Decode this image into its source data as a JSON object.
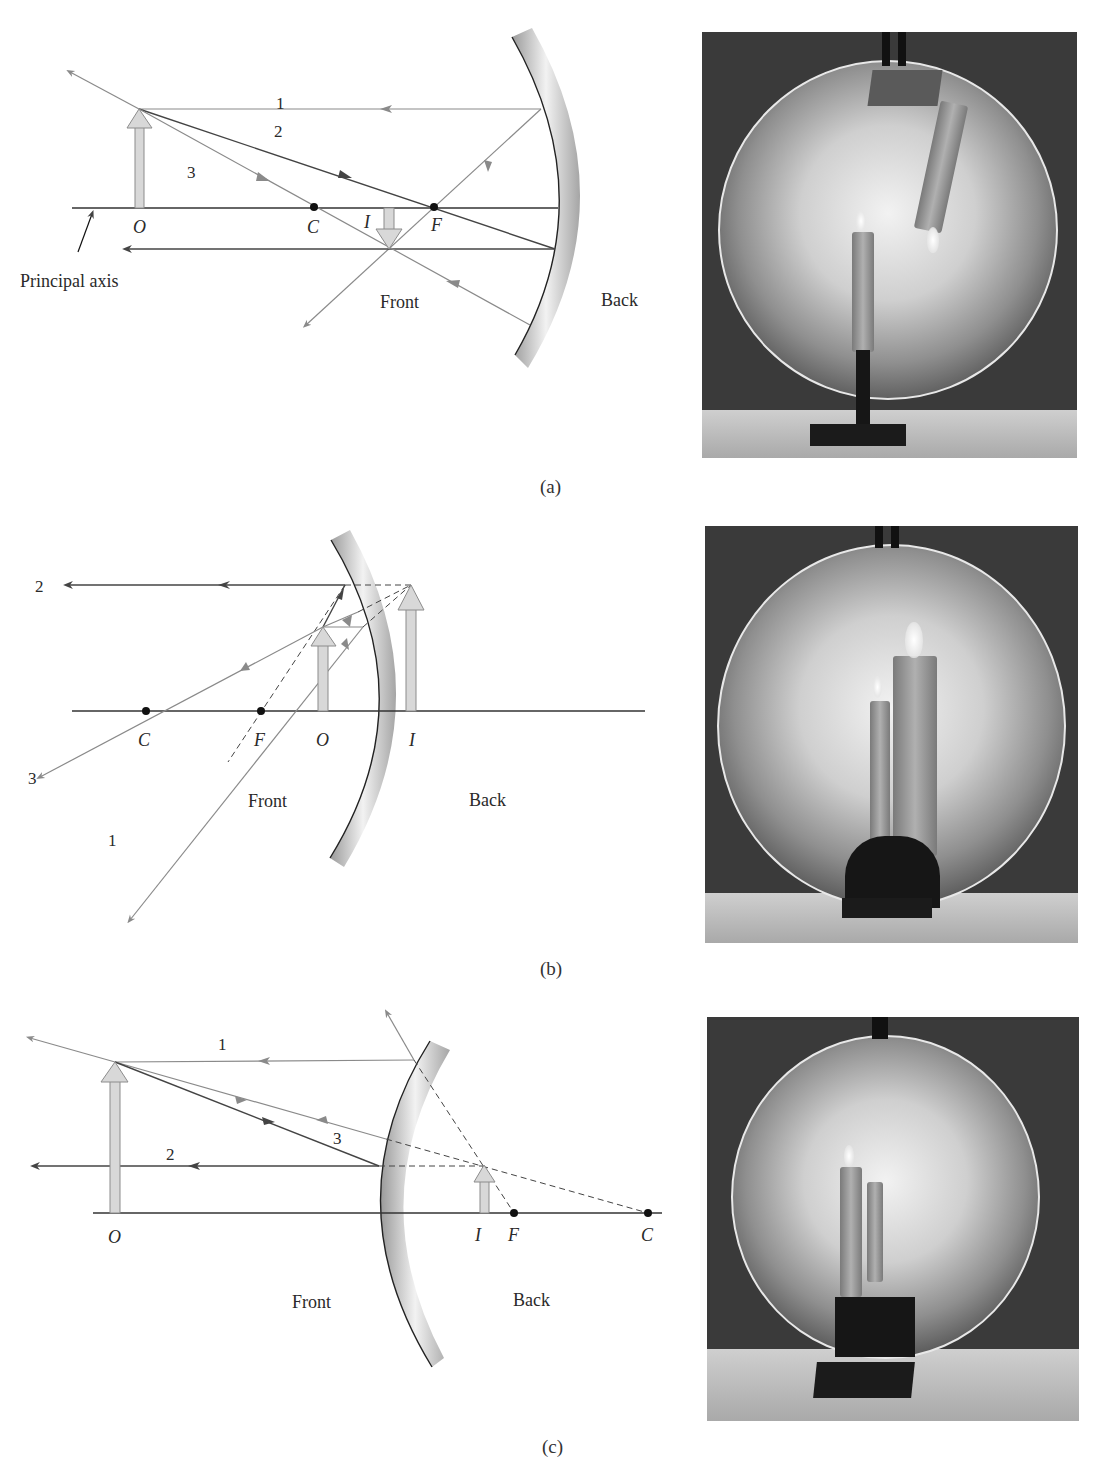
{
  "colors": {
    "ray_light": "#8a8a8a",
    "ray_dark": "#4a4a4a",
    "axis": "#333333",
    "arrow_fill": "#d8d8d8",
    "arrow_stroke": "#8c8c8c",
    "point": "#111111"
  },
  "panels": [
    {
      "id": "a",
      "caption": "(a)",
      "mirror_type": "concave",
      "labels": {
        "ray1": "1",
        "ray2": "2",
        "ray3": "3",
        "object": "O",
        "center": "C",
        "focus": "F",
        "image": "I",
        "front": "Front",
        "back": "Back",
        "principal_axis": "Principal axis"
      },
      "points": {
        "axis_y": 208,
        "axis_x0": 72,
        "axis_x1": 558,
        "object_x": 139,
        "object_tip_y": 109,
        "center_x": 314,
        "focus_x": 434,
        "image_x": 389,
        "image_tip_y": 249
      }
    },
    {
      "id": "b",
      "caption": "(b)",
      "mirror_type": "concave",
      "labels": {
        "ray1": "1",
        "ray2": "2",
        "ray3": "3",
        "object": "O",
        "center": "C",
        "focus": "F",
        "image": "I",
        "front": "Front",
        "back": "Back"
      },
      "points": {
        "axis_y": 711,
        "axis_x0": 72,
        "axis_x1": 645,
        "object_x": 323,
        "object_tip_y": 627,
        "center_x": 146,
        "focus_x": 261,
        "image_x": 411,
        "image_tip_y": 585
      }
    },
    {
      "id": "c",
      "caption": "(c)",
      "mirror_type": "convex",
      "labels": {
        "ray1": "1",
        "ray2": "2",
        "ray3": "3",
        "object": "O",
        "center": "C",
        "focus": "F",
        "image": "I",
        "front": "Front",
        "back": "Back"
      },
      "points": {
        "axis_y": 1213,
        "axis_x0": 93,
        "axis_x1": 662,
        "object_x": 115,
        "object_tip_y": 1062,
        "center_x": 648,
        "focus_x": 514,
        "image_x": 484,
        "image_tip_y": 1165
      }
    }
  ],
  "photos": [
    {
      "id": "photo-a",
      "description": "Concave mirror with candle, inverted image",
      "x": 702,
      "y": 32,
      "w": 375,
      "h": 426
    },
    {
      "id": "photo-b",
      "description": "Concave mirror with candle close, enlarged upright image",
      "x": 705,
      "y": 526,
      "w": 373,
      "h": 417
    },
    {
      "id": "photo-c",
      "description": "Convex mirror with candle, reduced upright image",
      "x": 707,
      "y": 1017,
      "w": 372,
      "h": 404
    }
  ]
}
